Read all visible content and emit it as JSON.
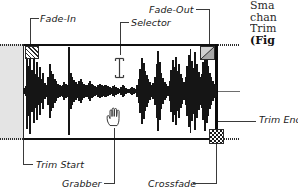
{
  "figure": {
    "type": "annotated-audio-waveform-editor"
  },
  "callouts": {
    "fade_in": "Fade-In",
    "fade_out": "Fade-Out",
    "selector": "Selector",
    "trim_end": "Trim End",
    "trim_start": "Trim Start",
    "grabber": "Grabber",
    "crossfade": "Crossfade"
  },
  "handles": {
    "fade_in_icon": "fade-in-hatched-square-handle",
    "fade_out_icon": "fade-out-gray-triangle-handle",
    "crossfade_icon": "crossfade-checkered-square-handle",
    "selector_icon": "i-beam-text-cursor",
    "grabber_icon": "open-hand-grabber-cursor"
  },
  "pane": {
    "trim_start_label": "trim-start-marker",
    "trim_end_label": "trim-end-marker",
    "untrimmed_region_label": "untrimmed-grayed-audio"
  },
  "body_text": {
    "line1": "Sma",
    "line2": "chan",
    "line3": "Trim",
    "line4": "(Fig"
  },
  "colors": {
    "waveform": "#151515",
    "gray_region": "#e4e4e4",
    "fade_out_handle": "#d0d0d0",
    "line": "#2b2b2b"
  },
  "chart_data": {
    "type": "area",
    "xlabel": "",
    "ylabel": "",
    "grid": false,
    "legend": "none",
    "ylim": [
      -1,
      1
    ],
    "envelope": [
      0.06,
      0.1,
      0.82,
      0.55,
      0.94,
      0.46,
      0.7,
      0.38,
      0.62,
      0.3,
      0.52,
      0.26,
      0.4,
      0.18,
      0.12,
      0.3,
      0.58,
      0.44,
      0.36,
      0.26,
      0.22,
      0.16,
      0.12,
      0.1,
      0.14,
      0.2,
      0.16,
      0.12,
      0.96,
      0.4,
      0.3,
      0.24,
      0.2,
      0.16,
      0.22,
      0.26,
      0.2,
      0.16,
      0.14,
      0.12,
      0.18,
      0.22,
      0.16,
      0.12,
      0.1,
      0.08,
      0.12,
      0.16,
      0.12,
      0.1,
      0.14,
      0.12,
      0.1,
      0.08,
      0.06,
      0.1,
      0.12,
      0.08,
      0.06,
      0.05,
      0.08,
      0.12,
      0.1,
      0.07,
      0.05,
      0.04,
      0.06,
      0.09,
      0.07,
      0.05,
      0.12,
      0.26,
      0.48,
      0.72,
      0.6,
      0.44,
      0.34,
      0.26,
      0.2,
      0.14,
      0.18,
      0.3,
      0.58,
      0.86,
      0.62,
      0.4,
      0.28,
      0.2,
      0.15,
      0.11,
      0.22,
      0.46,
      0.68,
      0.52,
      0.74,
      0.44,
      0.58,
      0.36,
      0.28,
      0.2,
      0.3,
      0.55,
      0.78,
      0.92,
      0.66,
      0.5,
      0.84,
      0.58,
      0.42,
      0.3,
      0.36,
      0.62,
      0.88,
      0.7,
      0.54,
      0.4,
      0.3,
      0.22,
      0.16,
      0.12
    ]
  }
}
